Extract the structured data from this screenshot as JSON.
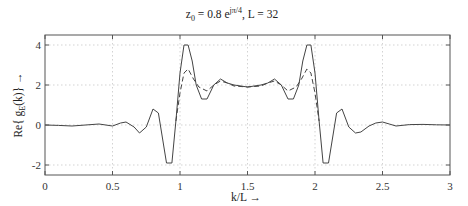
{
  "chart_data": {
    "type": "line",
    "title_parts": {
      "z": "z",
      "z_sub": "0",
      "eq": " = 0.8 e",
      "exp": "jπ/4",
      "tail": ",   L = 32"
    },
    "xlabel": "k/L  →",
    "ylabel": "Re{gE(k)}  →",
    "ylabel_parts": {
      "pre": "Re{ g",
      "sub": "E",
      "post": "(k)}  →"
    },
    "xlim": [
      0,
      3
    ],
    "ylim": [
      -2.5,
      4.5
    ],
    "xticks": [
      0,
      0.5,
      1,
      1.5,
      2,
      2.5,
      3
    ],
    "xtick_labels": [
      "0",
      "0.5",
      "1",
      "1.5",
      "2",
      "2.5",
      "3"
    ],
    "yticks": [
      -2,
      0,
      2,
      4
    ],
    "ytick_labels": [
      "-2",
      "0",
      "2",
      "4"
    ],
    "grid": true,
    "series": [
      {
        "name": "solid",
        "style": "solid",
        "x": [
          0,
          0.1,
          0.2,
          0.3,
          0.4,
          0.45,
          0.5,
          0.56,
          0.6,
          0.66,
          0.7,
          0.75,
          0.8,
          0.84,
          0.9,
          0.94,
          0.97,
          1.0,
          1.03,
          1.06,
          1.09,
          1.12,
          1.16,
          1.2,
          1.25,
          1.3,
          1.35,
          1.4,
          1.5,
          1.6,
          1.65,
          1.7,
          1.75,
          1.8,
          1.84,
          1.88,
          1.91,
          1.94,
          1.97,
          2.0,
          2.03,
          2.06,
          2.1,
          2.16,
          2.2,
          2.25,
          2.3,
          2.34,
          2.4,
          2.45,
          2.5,
          2.55,
          2.6,
          2.7,
          2.8,
          2.9,
          3.0
        ],
        "y": [
          0,
          -0.02,
          -0.05,
          0,
          0.05,
          0,
          -0.05,
          0.1,
          0.15,
          -0.1,
          -0.4,
          -0.1,
          0.8,
          0.6,
          -1.9,
          -1.9,
          0.2,
          2.6,
          4.0,
          4.0,
          3.2,
          2.0,
          1.3,
          1.3,
          2.0,
          2.3,
          2.1,
          2.0,
          1.9,
          2.0,
          2.1,
          2.3,
          2.0,
          1.3,
          1.3,
          2.0,
          3.2,
          4.0,
          4.0,
          2.6,
          0.2,
          -1.9,
          -1.9,
          0.6,
          0.8,
          -0.1,
          -0.4,
          -0.35,
          -0.05,
          0.1,
          0.15,
          0.05,
          -0.05,
          0.02,
          0.03,
          0.01,
          0
        ]
      },
      {
        "name": "dashed",
        "style": "dashed",
        "x": [
          0.97,
          1.0,
          1.03,
          1.06,
          1.1,
          1.14,
          1.2,
          1.25,
          1.3,
          1.35,
          1.4,
          1.5,
          1.6,
          1.65,
          1.7,
          1.75,
          1.8,
          1.86,
          1.9,
          1.94,
          1.97,
          2.0,
          2.03
        ],
        "y": [
          0.2,
          1.6,
          2.6,
          2.8,
          2.3,
          1.9,
          1.7,
          2.0,
          2.2,
          2.1,
          1.95,
          1.9,
          1.95,
          2.1,
          2.2,
          2.0,
          1.7,
          1.9,
          2.3,
          2.8,
          2.6,
          1.6,
          0.2
        ]
      }
    ]
  }
}
